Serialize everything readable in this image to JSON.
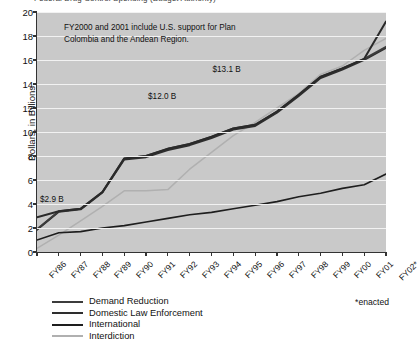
{
  "chart_title": "Federal Drug Control Spending (Budget Authority)",
  "footnote": "*enacted",
  "annotation": {
    "line1": "FY2000 and 2001 include U.S. support for Plan",
    "line2": "Colombia and the Andean Region."
  },
  "legend": {
    "items": [
      {
        "label": "Demand Reduction",
        "color": "#3c3c3c"
      },
      {
        "label": "Domestic Law Enforcement",
        "color": "#2e2e2e"
      },
      {
        "label": "International",
        "color": "#1e1e1e"
      },
      {
        "label": "Interdiction",
        "color": "#b0b0b0"
      }
    ]
  },
  "chart_data": {
    "type": "line",
    "title": "Federal Drug Control Spending (Budget Authority)",
    "xlabel": "",
    "ylabel": "Dollars, in Billions",
    "ylim": [
      0,
      20
    ],
    "ytick_values": [
      0,
      2,
      4,
      6,
      8,
      10,
      12,
      14,
      16,
      18,
      20
    ],
    "ytick_labels": [
      "0",
      "2",
      "4",
      "6",
      "8",
      "10",
      "12",
      "14",
      "16",
      "18",
      "20"
    ],
    "grid": true,
    "legend_position": "below",
    "categories": [
      "FY86",
      "FY87",
      "FY88",
      "FY89",
      "FY90",
      "FY91",
      "FY92",
      "FY93",
      "FY94",
      "FY95",
      "FY96",
      "FY97",
      "FY98",
      "FY99",
      "FY00",
      "FY01",
      "FY02*"
    ],
    "series": [
      {
        "name": "Demand Reduction",
        "color": "#3c3c3c",
        "values": [
          1.9,
          3.4,
          3.6,
          5.0,
          7.8,
          8.0,
          8.6,
          9.0,
          9.6,
          10.3,
          10.6,
          11.7,
          13.1,
          14.6,
          15.3,
          16.1,
          17.1
        ]
      },
      {
        "name": "Domestic Law Enforcement",
        "color": "#2e2e2e",
        "values": [
          1.85,
          3.35,
          3.55,
          4.95,
          7.7,
          7.9,
          8.5,
          8.9,
          9.5,
          10.2,
          10.5,
          11.6,
          13.0,
          14.5,
          15.2,
          16.0,
          17.0
        ]
      },
      {
        "name": "International",
        "color": "#1e1e1e",
        "values": [
          1.0,
          1.6,
          1.7,
          2.0,
          2.2,
          2.5,
          2.8,
          3.1,
          3.3,
          3.6,
          3.9,
          4.2,
          4.6,
          4.9,
          5.3,
          5.6,
          6.5
        ]
      },
      {
        "name": "Interdiction",
        "color": "#b0b0b0",
        "values": [
          0.3,
          1.4,
          2.6,
          3.8,
          5.1,
          5.1,
          5.2,
          6.9,
          8.3,
          9.7,
          10.8,
          12.0,
          13.2,
          14.8,
          15.5,
          16.8,
          17.8
        ]
      },
      {
        "name": "Total",
        "color": "#2a2a2a",
        "values": [
          2.9,
          3.4,
          3.6,
          5.0,
          7.8,
          8.0,
          8.6,
          9.0,
          9.6,
          10.3,
          10.6,
          11.7,
          13.1,
          14.6,
          15.3,
          16.1,
          19.2
        ]
      }
    ],
    "point_labels": [
      {
        "text": "$2.9 B",
        "x_index": 0,
        "value": 2.9
      },
      {
        "text": "$12.0 B",
        "x_index": 5,
        "value": 12.0
      },
      {
        "text": "$13.1 B",
        "x_index": 8,
        "value": 13.1
      },
      {
        "text": "$19.2 B",
        "x_index": 15,
        "value": 19.2
      }
    ],
    "annotations": [
      "FY2000 and 2001 include U.S. support for Plan",
      "Colombia and the Andean Region."
    ]
  }
}
